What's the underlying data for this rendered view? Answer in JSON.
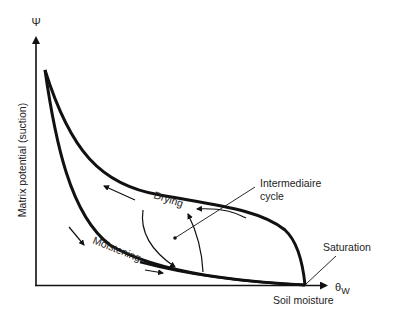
{
  "diagram": {
    "y_axis": {
      "symbol": "Ψ",
      "label": "Matrix potential (suction)"
    },
    "x_axis": {
      "symbol": "θ",
      "subscript": "W",
      "label": "Soil moisture"
    },
    "curves": [
      {
        "name": "drying-curve",
        "label": "Drying"
      },
      {
        "name": "moistening-curve",
        "label": "Moistening"
      }
    ],
    "annotations": {
      "intermediate": [
        "Intermediaire",
        "cycle"
      ],
      "saturation": "Saturation"
    },
    "colors": {
      "line": "#111111",
      "text": "#222222",
      "background": "#ffffff"
    }
  }
}
